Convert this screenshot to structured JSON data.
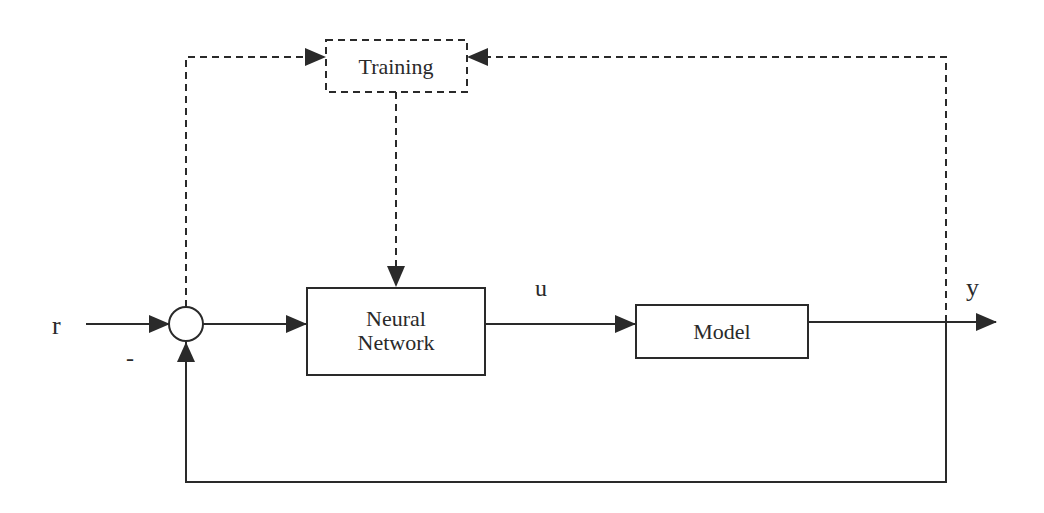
{
  "diagram": {
    "type": "control-loop block diagram",
    "blocks": {
      "training": {
        "label": "Training",
        "style": "dashed"
      },
      "neural_network": {
        "label_line1": "Neural",
        "label_line2": "Network",
        "style": "solid"
      },
      "model": {
        "label": "Model",
        "style": "solid"
      }
    },
    "signals": {
      "reference": "r",
      "control": "u",
      "output": "y",
      "feedback_sign": "-"
    },
    "summing_junction": {
      "shape": "circle"
    },
    "colors": {
      "line": "#2a2a2a",
      "background": "#ffffff"
    }
  }
}
